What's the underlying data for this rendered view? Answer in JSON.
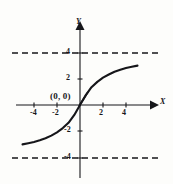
{
  "figure": {
    "name": "sigmoid-curve-with-horizontal-asymptotes",
    "background_color": "#fdfdfb",
    "ink_color": "#16161a"
  },
  "axes": {
    "x_axis_label": "X",
    "y_axis_label": "Y",
    "x_ticks": [
      "-4",
      "-2",
      "2",
      "4"
    ],
    "y_ticks": [
      "4",
      "2",
      "-2",
      "-4"
    ]
  },
  "annotations": {
    "origin_label": "(0, 0)"
  },
  "chart_data": {
    "type": "line",
    "title": "",
    "xlabel": "X",
    "ylabel": "Y",
    "xlim": [
      -5.2,
      5.2
    ],
    "ylim": [
      -5.2,
      5.2
    ],
    "grid": false,
    "legend": "none",
    "xticks": [
      -4,
      -2,
      2,
      4
    ],
    "yticks": [
      4,
      2,
      -2,
      -4
    ],
    "annotations": [
      {
        "text": "(0, 0)",
        "x": 0,
        "y": 0
      }
    ],
    "asymptotes": [
      {
        "type": "horizontal",
        "y": 4,
        "style": "dashed"
      },
      {
        "type": "horizontal",
        "y": -4,
        "style": "dashed"
      }
    ],
    "series": [
      {
        "name": "y = (8/pi) * arctan(x/1.6)",
        "style": "solid",
        "x": [
          -5.0,
          -4.5,
          -4.0,
          -3.5,
          -3.0,
          -2.5,
          -2.0,
          -1.5,
          -1.0,
          -0.5,
          0.0,
          0.5,
          1.0,
          1.5,
          2.0,
          2.5,
          3.0,
          3.5,
          4.0,
          4.5,
          5.0
        ],
        "y": [
          -3.03,
          -2.94,
          -2.84,
          -2.71,
          -2.55,
          -2.35,
          -2.1,
          -1.78,
          -1.37,
          -0.76,
          0.0,
          0.76,
          1.37,
          1.78,
          2.1,
          2.35,
          2.55,
          2.71,
          2.84,
          2.94,
          3.03
        ]
      }
    ]
  }
}
